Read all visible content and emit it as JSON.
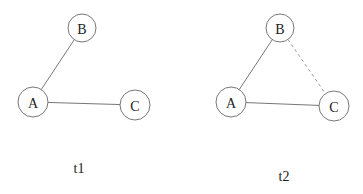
{
  "graphs": [
    {
      "label": "t1",
      "label_pos": [
        79,
        173
      ],
      "nodes": [
        {
          "id": "A",
          "label": "A",
          "x": 33,
          "y": 102,
          "r": 15
        },
        {
          "id": "B",
          "label": "B",
          "x": 82,
          "y": 28,
          "r": 14
        },
        {
          "id": "C",
          "label": "C",
          "x": 135,
          "y": 105,
          "r": 15
        }
      ],
      "edges": [
        {
          "from": "A",
          "to": "B",
          "style": "solid"
        },
        {
          "from": "A",
          "to": "C",
          "style": "solid"
        }
      ]
    },
    {
      "label": "t2",
      "label_pos": [
        284,
        181
      ],
      "nodes": [
        {
          "id": "A",
          "label": "A",
          "x": 231,
          "y": 102,
          "r": 15
        },
        {
          "id": "B",
          "label": "B",
          "x": 280,
          "y": 28,
          "r": 14
        },
        {
          "id": "C",
          "label": "C",
          "x": 334,
          "y": 106,
          "r": 15
        }
      ],
      "edges": [
        {
          "from": "A",
          "to": "B",
          "style": "solid"
        },
        {
          "from": "A",
          "to": "C",
          "style": "solid"
        },
        {
          "from": "B",
          "to": "C",
          "style": "dashed"
        }
      ]
    }
  ]
}
